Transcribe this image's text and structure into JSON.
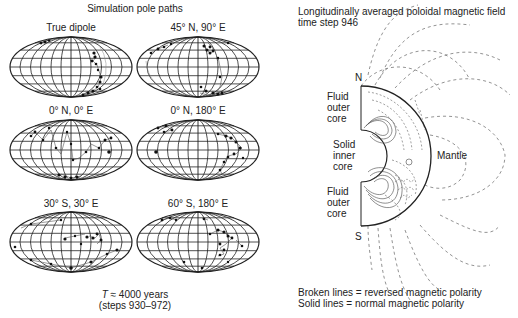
{
  "left_panel": {
    "title": "Simulation pole paths",
    "maps": [
      {
        "label": "True dipole"
      },
      {
        "label": "45° N, 90° E"
      },
      {
        "label": "0° N, 0° E"
      },
      {
        "label": "0° N, 180° E"
      },
      {
        "label": "30° S, 30° E"
      },
      {
        "label": "60° S, 180° E"
      }
    ],
    "caption_line1_italic": "T",
    "caption_line1_rest": " ≈ 4000 years",
    "caption_line2": "(steps 930–972)"
  },
  "right_panel": {
    "title_line1": "Longitudinally averaged poloidal magnetic field",
    "title_line2": "time step 946",
    "labels": {
      "north": "N",
      "south": "S",
      "fluid_outer_core_top": [
        "Fluid",
        "outer",
        "core"
      ],
      "solid_inner_core": [
        "Solid",
        "inner",
        "core"
      ],
      "fluid_outer_core_bottom": [
        "Fluid",
        "outer",
        "core"
      ],
      "mantle": "Mantle"
    },
    "legend_line1": "Broken lines = reversed magnetic polarity",
    "legend_line2": "Solid lines = normal magnetic polarity"
  },
  "colors": {
    "ink": "#222222",
    "dashed": "#777777",
    "background": "#ffffff"
  }
}
